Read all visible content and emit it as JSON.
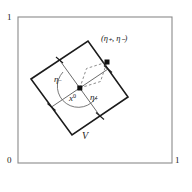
{
  "figure": {
    "axis_labels": {
      "top_left": "1",
      "bottom_left": "0",
      "bottom_right": "1"
    },
    "annotations": {
      "point_pair": "(η₊, η₋)",
      "eta_minus": "η",
      "eta_minus_sub": "−",
      "eta_plus": "η",
      "eta_plus_sub": "+",
      "center_point": "x",
      "center_point_sup": "0",
      "region": "V"
    },
    "colors": {
      "outer_box_stroke": "#8a8a8a",
      "square_stroke": "#1b1b1b",
      "grid_stroke": "#5a5a5a",
      "dashed_stroke": "#7a7a7a",
      "arc_stroke": "#6a6a6a",
      "point_fill": "#111111",
      "background": "#ffffff",
      "text": "#1b1b1b"
    },
    "geometry": {
      "outer_box": {
        "x": 18,
        "y": 17,
        "width": 154,
        "height": 146
      },
      "rotated_square_vertices": [
        {
          "name": "left",
          "x": 31,
          "y": 79
        },
        {
          "name": "top",
          "x": 88,
          "y": 41
        },
        {
          "name": "right",
          "x": 128,
          "y": 97
        },
        {
          "name": "bottom",
          "x": 72,
          "y": 135
        }
      ],
      "center": {
        "x": 79.8,
        "y": 88
      },
      "marked_point": {
        "x": 107,
        "y": 62
      },
      "tick_count": 4
    }
  }
}
